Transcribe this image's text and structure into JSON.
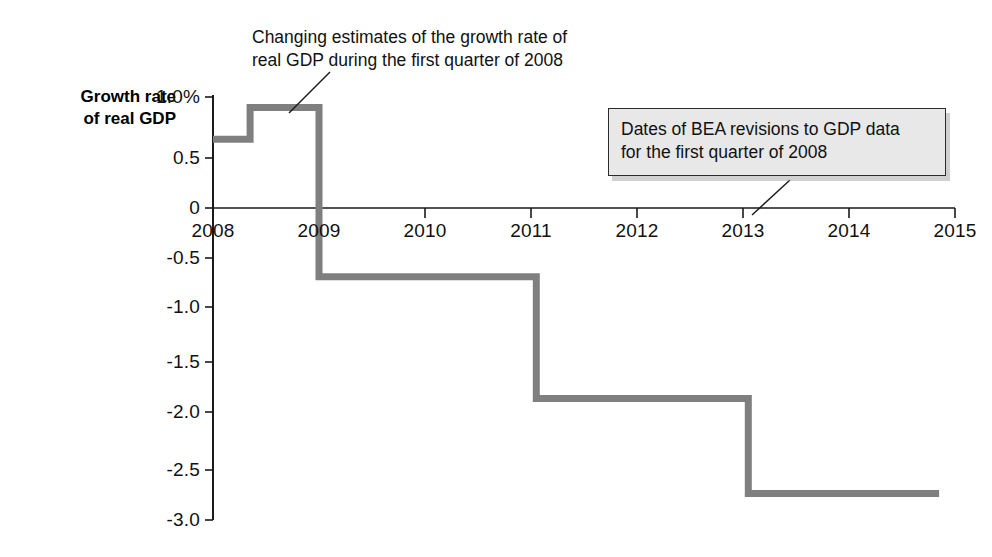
{
  "chart_data": {
    "type": "line",
    "subtype": "step",
    "title": "",
    "xlabel": "",
    "ylabel": "Growth rate of real GDP",
    "xlim": [
      2008,
      2015
    ],
    "ylim": [
      -3.0,
      1.0
    ],
    "grid": false,
    "legend_position": "none",
    "x_ticks": [
      "2008",
      "2009",
      "2010",
      "2011",
      "2012",
      "2013",
      "2014",
      "2015"
    ],
    "x_tick_values": [
      2008,
      2009,
      2010,
      2011,
      2012,
      2013,
      2014,
      2015
    ],
    "y_ticks": [
      "1.0%",
      "0.5",
      "0",
      "-0.5",
      "-1.0",
      "-1.5",
      "-2.0",
      "-2.5",
      "-3.0"
    ],
    "y_tick_values": [
      1.0,
      0.5,
      0,
      -0.5,
      -1.0,
      -1.5,
      -2.0,
      -2.5,
      -3.0
    ],
    "series": [
      {
        "name": "Estimated growth rate of real GDP, first quarter 2008",
        "color": "#7f7f7f",
        "steps": [
          {
            "x_start": 2008.0,
            "x_end": 2008.35,
            "value": 0.6
          },
          {
            "x_start": 2008.35,
            "x_end": 2009.0,
            "value": 0.9
          },
          {
            "x_start": 2009.0,
            "x_end": 2011.05,
            "value": -0.7
          },
          {
            "x_start": 2011.05,
            "x_end": 2013.05,
            "value": -1.85
          },
          {
            "x_start": 2013.05,
            "x_end": 2014.85,
            "value": -2.75
          }
        ]
      }
    ],
    "annotations": [
      {
        "id": "growth-estimates-note",
        "text": "Changing estimates of the growth rate of real GDP during the first quarter of 2008",
        "boxed": false,
        "leader_line": true
      },
      {
        "id": "bea-revisions-note",
        "text": "Dates of BEA revisions to GDP data for the first quarter of 2008",
        "boxed": true,
        "leader_line": true
      }
    ]
  },
  "axis": {
    "y_title_line1": "Growth rate",
    "y_title_line2": "of real GDP"
  },
  "annotations": {
    "top_note_line1": "Changing estimates of the growth rate of",
    "top_note_line2": "real GDP during the first quarter of 2008",
    "box_note_line1": "Dates of BEA revisions to GDP data",
    "box_note_line2": "for the first quarter of 2008"
  },
  "colors": {
    "series_line": "#7f7f7f",
    "axis": "#1a1a1a",
    "box_fill": "#e8e8e8",
    "box_border": "#2c2c2c"
  }
}
